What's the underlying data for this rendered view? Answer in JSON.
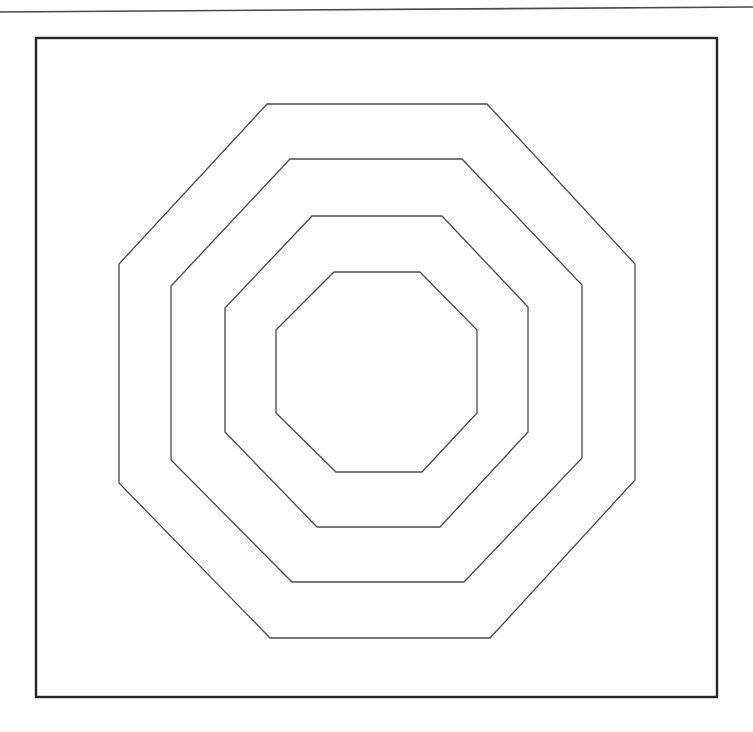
{
  "page": {
    "width": 753,
    "height": 732,
    "background_color": "#ffffff"
  },
  "top_rule": {
    "name": "page-top-rule",
    "x1": 0,
    "y1": 12,
    "x2": 753,
    "y2": 7,
    "color": "#4a4a4a",
    "thickness": 1.6
  },
  "frame": {
    "name": "figure-frame",
    "x": 36,
    "y": 38,
    "width": 681,
    "height": 659,
    "color": "#242424",
    "thickness": 2.4,
    "fill": "none"
  },
  "chart_data": {
    "type": "line",
    "xlabel": "",
    "ylabel": "",
    "grid": false,
    "legend_position": "none",
    "xlim": [
      0,
      753
    ],
    "ylim": [
      732,
      0
    ],
    "center": {
      "x": 377,
      "y": 371
    },
    "stroke_color": "#4e4e4e",
    "stroke_width": 1.35,
    "shape": "octagon",
    "count": 4,
    "series": [
      {
        "name": "octagon-1-outer",
        "index": 1,
        "circumradius": 279,
        "half_width": 258,
        "half_height": 267,
        "bounds": {
          "left": 119,
          "right": 635,
          "top": 104,
          "bottom": 638
        },
        "points": [
          {
            "x": 267,
            "y": 104
          },
          {
            "x": 487,
            "y": 104
          },
          {
            "x": 635,
            "y": 264
          },
          {
            "x": 635,
            "y": 480
          },
          {
            "x": 490,
            "y": 638
          },
          {
            "x": 270,
            "y": 638
          },
          {
            "x": 119,
            "y": 483
          },
          {
            "x": 119,
            "y": 264
          }
        ]
      },
      {
        "name": "octagon-2",
        "index": 2,
        "circumradius": 221,
        "half_width": 206,
        "half_height": 212,
        "bounds": {
          "left": 171,
          "right": 582,
          "top": 159,
          "bottom": 582
        },
        "points": [
          {
            "x": 290,
            "y": 159
          },
          {
            "x": 462,
            "y": 159
          },
          {
            "x": 582,
            "y": 285
          },
          {
            "x": 582,
            "y": 458
          },
          {
            "x": 464,
            "y": 582
          },
          {
            "x": 292,
            "y": 582
          },
          {
            "x": 171,
            "y": 460
          },
          {
            "x": 171,
            "y": 286
          }
        ]
      },
      {
        "name": "octagon-3",
        "index": 3,
        "circumradius": 163,
        "half_width": 152,
        "half_height": 156,
        "bounds": {
          "left": 225,
          "right": 528,
          "top": 216,
          "bottom": 527
        },
        "points": [
          {
            "x": 312,
            "y": 216
          },
          {
            "x": 442,
            "y": 216
          },
          {
            "x": 528,
            "y": 307
          },
          {
            "x": 528,
            "y": 432
          },
          {
            "x": 440,
            "y": 527
          },
          {
            "x": 317,
            "y": 527
          },
          {
            "x": 225,
            "y": 432
          },
          {
            "x": 225,
            "y": 308
          }
        ]
      },
      {
        "name": "octagon-4-inner",
        "index": 4,
        "circumradius": 106,
        "half_width": 100,
        "half_height": 100,
        "bounds": {
          "left": 276,
          "right": 477,
          "top": 272,
          "bottom": 472
        },
        "points": [
          {
            "x": 334,
            "y": 272
          },
          {
            "x": 420,
            "y": 272
          },
          {
            "x": 477,
            "y": 330
          },
          {
            "x": 477,
            "y": 413
          },
          {
            "x": 422,
            "y": 472
          },
          {
            "x": 336,
            "y": 472
          },
          {
            "x": 276,
            "y": 413
          },
          {
            "x": 276,
            "y": 330
          }
        ]
      }
    ]
  }
}
